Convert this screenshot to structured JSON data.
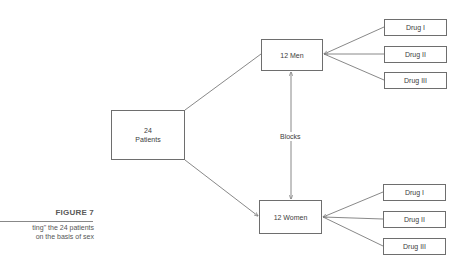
{
  "figure": {
    "title": "FIGURE 7",
    "caption_lines": [
      "ting\" the 24 patients",
      "on the basis of sex"
    ]
  },
  "nodes": {
    "patients": {
      "lines": [
        "24",
        "Patients"
      ]
    },
    "men": {
      "label": "12 Men"
    },
    "women": {
      "label": "12 Women"
    },
    "men_drugs": [
      {
        "label": "Drug I"
      },
      {
        "label": "Drug II"
      },
      {
        "label": "Drug III"
      }
    ],
    "women_drugs": [
      {
        "label": "Drug I"
      },
      {
        "label": "Drug II"
      },
      {
        "label": "Drug III"
      }
    ]
  },
  "edges": {
    "blocks_label": "Blocks"
  },
  "colors": {
    "line": "#7a7a7a",
    "border": "#6e6e6e",
    "text": "#3c3c3c"
  }
}
